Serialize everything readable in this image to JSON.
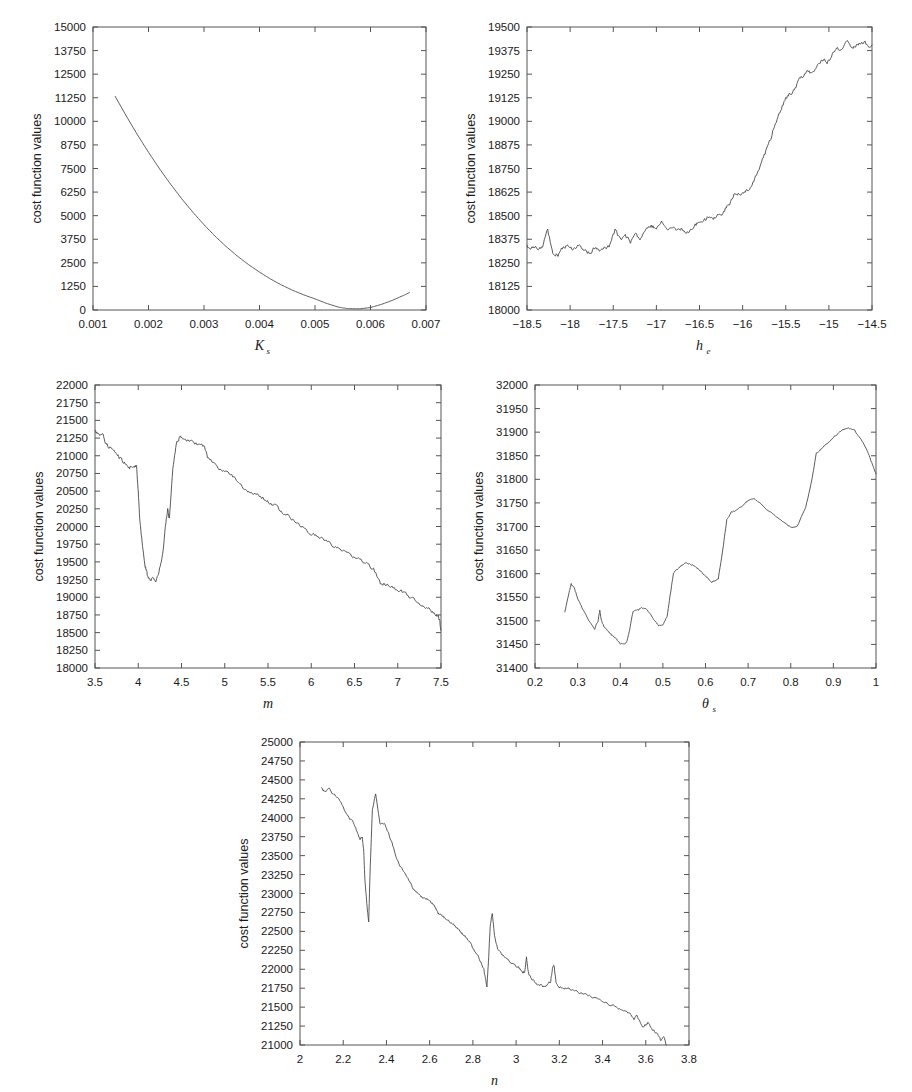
{
  "figure": {
    "ylabel": "cost function values",
    "panel_count": 5
  },
  "chart_data": [
    {
      "id": "panel-ks",
      "type": "line",
      "title": "",
      "xlabel": "K",
      "xlabel_sub": "s",
      "ylabel": "cost function values",
      "xlim": [
        0.001,
        0.007
      ],
      "ylim": [
        0,
        15000
      ],
      "xticks": [
        "0.001",
        "0.002",
        "0.003",
        "0.004",
        "0.005",
        "0.006",
        "0.007"
      ],
      "xtick_values": [
        0.001,
        0.002,
        0.003,
        0.004,
        0.005,
        0.006,
        0.007
      ],
      "yticks": [
        "0",
        "1250",
        "2500",
        "3750",
        "5000",
        "6250",
        "7500",
        "8750",
        "10000",
        "11250",
        "12500",
        "13750",
        "15000"
      ],
      "ytick_values": [
        0,
        1250,
        2500,
        3750,
        5000,
        6250,
        7500,
        8750,
        10000,
        11250,
        12500,
        13750,
        15000
      ],
      "grid": false,
      "legend": null,
      "x": [
        0.0014,
        0.0016,
        0.0018,
        0.002,
        0.0022,
        0.0024,
        0.0026,
        0.0028,
        0.003,
        0.0032,
        0.0034,
        0.0036,
        0.0038,
        0.004,
        0.0042,
        0.0044,
        0.0046,
        0.0048,
        0.005,
        0.0052,
        0.0054,
        0.0055,
        0.0056,
        0.0058,
        0.006,
        0.0062,
        0.0064,
        0.0066,
        0.0067
      ],
      "y": [
        11320,
        10280,
        9290,
        8360,
        7480,
        6660,
        5890,
        5180,
        4520,
        3910,
        3360,
        2860,
        2410,
        2010,
        1640,
        1320,
        1040,
        800,
        590,
        360,
        170,
        110,
        70,
        60,
        130,
        300,
        520,
        780,
        920
      ]
    },
    {
      "id": "panel-he",
      "type": "line",
      "title": "",
      "xlabel": "h",
      "xlabel_sub": "e",
      "ylabel": "cost function values",
      "xlim": [
        -18.5,
        -14.5
      ],
      "ylim": [
        18000,
        19500
      ],
      "xticks": [
        "-18.5",
        "-18",
        "-17.5",
        "-17",
        "-16.5",
        "-16",
        "-15.5",
        "-15",
        "-14.5"
      ],
      "xtick_values": [
        -18.5,
        -18,
        -17.5,
        -17,
        -16.5,
        -16,
        -15.5,
        -15,
        -14.5
      ],
      "yticks": [
        "18000",
        "18125",
        "18250",
        "18375",
        "18500",
        "18625",
        "18750",
        "18875",
        "19000",
        "19125",
        "19250",
        "19375",
        "19500"
      ],
      "ytick_values": [
        18000,
        18125,
        18250,
        18375,
        18500,
        18625,
        18750,
        18875,
        19000,
        19125,
        19250,
        19375,
        19500
      ],
      "grid": false,
      "legend": null,
      "noise_seed": 17,
      "x": [
        -18.5,
        -18.44,
        -18.38,
        -18.32,
        -18.26,
        -18.2,
        -18.14,
        -18.08,
        -18.02,
        -17.96,
        -17.9,
        -17.84,
        -17.78,
        -17.72,
        -17.66,
        -17.6,
        -17.54,
        -17.48,
        -17.42,
        -17.36,
        -17.3,
        -17.24,
        -17.18,
        -17.12,
        -17.06,
        -17.0,
        -16.94,
        -16.88,
        -16.82,
        -16.76,
        -16.7,
        -16.64,
        -16.58,
        -16.52,
        -16.46,
        -16.4,
        -16.34,
        -16.28,
        -16.22,
        -16.16,
        -16.1,
        -16.04,
        -15.98,
        -15.92,
        -15.86,
        -15.8,
        -15.74,
        -15.68,
        -15.62,
        -15.56,
        -15.5,
        -15.44,
        -15.38,
        -15.32,
        -15.26,
        -15.2,
        -15.14,
        -15.08,
        -15.02,
        -14.96,
        -14.9,
        -14.84,
        -14.78,
        -14.72,
        -14.66,
        -14.6,
        -14.54,
        -14.5
      ],
      "y": [
        18337,
        18330,
        18325,
        18340,
        18420,
        18300,
        18290,
        18330,
        18345,
        18320,
        18350,
        18325,
        18300,
        18330,
        18310,
        18325,
        18340,
        18420,
        18370,
        18390,
        18360,
        18400,
        18380,
        18420,
        18450,
        18430,
        18470,
        18420,
        18440,
        18425,
        18435,
        18415,
        18440,
        18460,
        18470,
        18490,
        18480,
        18500,
        18520,
        18560,
        18610,
        18620,
        18630,
        18640,
        18690,
        18760,
        18830,
        18900,
        18990,
        19060,
        19120,
        19150,
        19190,
        19230,
        19270,
        19250,
        19290,
        19330,
        19310,
        19350,
        19380,
        19400,
        19420,
        19400,
        19410,
        19420,
        19405,
        19400
      ]
    },
    {
      "id": "panel-m",
      "type": "line",
      "title": "",
      "xlabel": "m",
      "xlabel_sub": "",
      "ylabel": "cost function values",
      "xlim": [
        3.5,
        7.5
      ],
      "ylim": [
        18000,
        22000
      ],
      "xticks": [
        "3.5",
        "4",
        "4.5",
        "5",
        "5.5",
        "6",
        "6.5",
        "7",
        "7.5"
      ],
      "xtick_values": [
        3.5,
        4,
        4.5,
        5,
        5.5,
        6,
        6.5,
        7,
        7.5
      ],
      "yticks": [
        "18000",
        "18250",
        "18500",
        "18750",
        "19000",
        "19250",
        "19500",
        "19750",
        "20000",
        "20250",
        "20500",
        "20750",
        "21000",
        "21250",
        "21500",
        "21750",
        "22000"
      ],
      "ytick_values": [
        18000,
        18250,
        18500,
        18750,
        19000,
        19250,
        19500,
        19750,
        20000,
        20250,
        20500,
        20750,
        21000,
        21250,
        21500,
        21750,
        22000
      ],
      "grid": false,
      "legend": null,
      "x": [
        3.5,
        3.54,
        3.58,
        3.62,
        3.66,
        3.7,
        3.74,
        3.78,
        3.82,
        3.86,
        3.9,
        3.94,
        3.98,
        4.0,
        4.02,
        4.05,
        4.08,
        4.11,
        4.14,
        4.17,
        4.2,
        4.24,
        4.28,
        4.32,
        4.34,
        4.36,
        4.4,
        4.44,
        4.48,
        4.52,
        4.6,
        4.68,
        4.76,
        4.8,
        4.88,
        4.96,
        5.04,
        5.12,
        5.2,
        5.28,
        5.36,
        5.44,
        5.52,
        5.6,
        5.68,
        5.76,
        5.84,
        5.92,
        6.0,
        6.08,
        6.16,
        6.24,
        6.32,
        6.4,
        6.48,
        6.56,
        6.64,
        6.72,
        6.8,
        6.88,
        6.96,
        7.04,
        7.12,
        7.2,
        7.28,
        7.36,
        7.42,
        7.46,
        7.48,
        7.5
      ],
      "y": [
        21350,
        21290,
        21330,
        21200,
        21120,
        21080,
        21050,
        20980,
        20930,
        20880,
        20830,
        20870,
        20860,
        20500,
        20050,
        19700,
        19450,
        19290,
        19220,
        19270,
        19230,
        19350,
        19600,
        20050,
        20250,
        20100,
        20800,
        21180,
        21260,
        21250,
        21200,
        21170,
        21140,
        20980,
        20880,
        20790,
        20740,
        20690,
        20560,
        20480,
        20450,
        20400,
        20330,
        20280,
        20190,
        20130,
        20050,
        19960,
        19900,
        19860,
        19800,
        19730,
        19700,
        19640,
        19580,
        19540,
        19480,
        19400,
        19200,
        19180,
        19130,
        19080,
        19020,
        18950,
        18890,
        18830,
        18760,
        18740,
        18700,
        18520
      ]
    },
    {
      "id": "panel-thetas",
      "type": "line",
      "title": "",
      "xlabel": "θ",
      "xlabel_sub": "s",
      "ylabel": "cost function values",
      "xlim": [
        0.2,
        1.0
      ],
      "ylim": [
        31400,
        32000
      ],
      "xticks": [
        "0.2",
        "0.3",
        "0.4",
        "0.5",
        "0.6",
        "0.7",
        "0.8",
        "0.9",
        "1"
      ],
      "xtick_values": [
        0.2,
        0.3,
        0.4,
        0.5,
        0.6,
        0.7,
        0.8,
        0.9,
        1.0
      ],
      "yticks": [
        "31400",
        "31450",
        "31500",
        "31550",
        "31600",
        "31650",
        "31700",
        "31750",
        "31800",
        "31850",
        "31900",
        "31950",
        "32000"
      ],
      "ytick_values": [
        31400,
        31450,
        31500,
        31550,
        31600,
        31650,
        31700,
        31750,
        31800,
        31850,
        31900,
        31950,
        32000
      ],
      "grid": false,
      "legend": null,
      "x": [
        0.27,
        0.28,
        0.285,
        0.292,
        0.3,
        0.31,
        0.32,
        0.33,
        0.34,
        0.348,
        0.352,
        0.356,
        0.362,
        0.37,
        0.38,
        0.39,
        0.4,
        0.408,
        0.415,
        0.422,
        0.43,
        0.44,
        0.45,
        0.46,
        0.47,
        0.48,
        0.49,
        0.5,
        0.51,
        0.518,
        0.525,
        0.535,
        0.545,
        0.555,
        0.57,
        0.585,
        0.6,
        0.615,
        0.63,
        0.642,
        0.65,
        0.66,
        0.67,
        0.685,
        0.7,
        0.712,
        0.725,
        0.74,
        0.76,
        0.78,
        0.8,
        0.815,
        0.835,
        0.85,
        0.86,
        0.875,
        0.89,
        0.905,
        0.92,
        0.935,
        0.95,
        0.965,
        0.98,
        0.992,
        1.0
      ],
      "y": [
        31518,
        31560,
        31578,
        31570,
        31548,
        31528,
        31510,
        31495,
        31483,
        31500,
        31522,
        31500,
        31487,
        31480,
        31470,
        31462,
        31452,
        31450,
        31455,
        31480,
        31520,
        31522,
        31528,
        31525,
        31515,
        31500,
        31490,
        31492,
        31510,
        31560,
        31602,
        31610,
        31618,
        31624,
        31618,
        31608,
        31595,
        31583,
        31590,
        31660,
        31715,
        31730,
        31733,
        31742,
        31755,
        31760,
        31752,
        31740,
        31725,
        31710,
        31698,
        31700,
        31740,
        31800,
        31855,
        31868,
        31880,
        31893,
        31903,
        31910,
        31903,
        31885,
        31860,
        31830,
        31810
      ]
    },
    {
      "id": "panel-n",
      "type": "line",
      "title": "",
      "xlabel": "n",
      "xlabel_sub": "",
      "ylabel": "cost function values",
      "xlim": [
        2.0,
        3.8
      ],
      "ylim": [
        21000,
        25000
      ],
      "xticks": [
        "2",
        "2.2",
        "2.4",
        "2.6",
        "2.8",
        "3",
        "3.2",
        "3.4",
        "3.6",
        "3.8"
      ],
      "xtick_values": [
        2.0,
        2.2,
        2.4,
        2.6,
        2.8,
        3.0,
        3.2,
        3.4,
        3.6,
        3.8
      ],
      "yticks": [
        "21000",
        "21250",
        "21500",
        "21750",
        "22000",
        "22250",
        "22500",
        "22750",
        "23000",
        "23250",
        "23500",
        "23750",
        "24000",
        "24250",
        "24500",
        "24750",
        "25000"
      ],
      "ytick_values": [
        21000,
        21250,
        21500,
        21750,
        22000,
        22250,
        22500,
        22750,
        23000,
        23250,
        23500,
        23750,
        24000,
        24250,
        24500,
        24750,
        25000
      ],
      "grid": false,
      "legend": null,
      "x": [
        2.1,
        2.115,
        2.13,
        2.15,
        2.17,
        2.19,
        2.21,
        2.23,
        2.25,
        2.265,
        2.278,
        2.288,
        2.295,
        2.3,
        2.306,
        2.312,
        2.318,
        2.325,
        2.335,
        2.35,
        2.37,
        2.39,
        2.41,
        2.43,
        2.45,
        2.47,
        2.49,
        2.51,
        2.53,
        2.55,
        2.57,
        2.59,
        2.61,
        2.625,
        2.635,
        2.642,
        2.655,
        2.67,
        2.69,
        2.71,
        2.73,
        2.75,
        2.77,
        2.79,
        2.81,
        2.83,
        2.85,
        2.858,
        2.865,
        2.872,
        2.88,
        2.89,
        2.9,
        2.915,
        2.935,
        2.96,
        2.985,
        3.01,
        3.03,
        3.04,
        3.048,
        3.058,
        3.07,
        3.085,
        3.1,
        3.115,
        3.13,
        3.145,
        3.16,
        3.168,
        3.175,
        3.185,
        3.2,
        3.215,
        3.24,
        3.27,
        3.3,
        3.33,
        3.36,
        3.39,
        3.42,
        3.45,
        3.475,
        3.5,
        3.525,
        3.545,
        3.56,
        3.575,
        3.59,
        3.61,
        3.625,
        3.64,
        3.655,
        3.67,
        3.685,
        3.695
      ],
      "y": [
        24390,
        24330,
        24400,
        24330,
        24280,
        24190,
        24080,
        23990,
        23930,
        23810,
        23720,
        23760,
        23560,
        23200,
        22980,
        22760,
        22640,
        23350,
        24100,
        24310,
        23930,
        23920,
        23800,
        23620,
        23440,
        23330,
        23230,
        23150,
        23030,
        23000,
        22930,
        22930,
        22870,
        22820,
        22760,
        22730,
        22700,
        22680,
        22630,
        22590,
        22530,
        22470,
        22420,
        22330,
        22240,
        22140,
        22010,
        21870,
        21780,
        22100,
        22560,
        22740,
        22450,
        22260,
        22200,
        22130,
        22070,
        22030,
        21960,
        21970,
        22160,
        21930,
        21880,
        21830,
        21800,
        21790,
        21760,
        21800,
        21840,
        22000,
        22060,
        21840,
        21760,
        21760,
        21740,
        21720,
        21690,
        21660,
        21620,
        21590,
        21550,
        21520,
        21490,
        21460,
        21410,
        21340,
        21390,
        21300,
        21240,
        21290,
        21220,
        21180,
        21150,
        21060,
        21100,
        21000
      ]
    }
  ],
  "panels": [
    {
      "id": "panel-ks",
      "name": "cost-vs-ks"
    },
    {
      "id": "panel-he",
      "name": "cost-vs-he"
    },
    {
      "id": "panel-m",
      "name": "cost-vs-m"
    },
    {
      "id": "panel-thetas",
      "name": "cost-vs-thetas"
    },
    {
      "id": "panel-n",
      "name": "cost-vs-n"
    }
  ]
}
